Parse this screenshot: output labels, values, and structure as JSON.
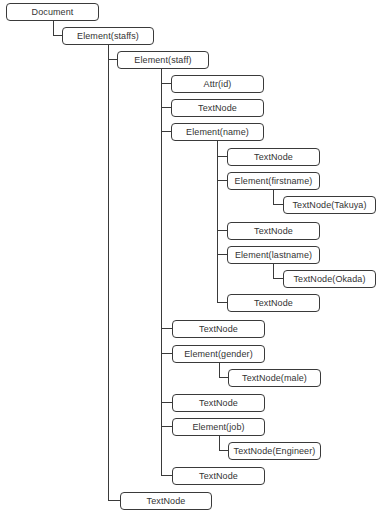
{
  "diagram": {
    "line_color": "#3a3a3a",
    "nodes": [
      {
        "label": "Document",
        "x": 6,
        "y": 3,
        "w": 93
      },
      {
        "label": "Element(staffs)",
        "x": 62,
        "y": 27,
        "w": 92
      },
      {
        "label": "Element(staff)",
        "x": 117,
        "y": 51,
        "w": 92
      },
      {
        "label": "Attr(id)",
        "x": 171,
        "y": 75,
        "w": 93
      },
      {
        "label": "TextNode",
        "x": 171,
        "y": 99,
        "w": 93
      },
      {
        "label": "Element(name)",
        "x": 171,
        "y": 123,
        "w": 93
      },
      {
        "label": "TextNode",
        "x": 227,
        "y": 148,
        "w": 93
      },
      {
        "label": "Element(firstname)",
        "x": 227,
        "y": 172,
        "w": 93
      },
      {
        "label": "TextNode(Takuya)",
        "x": 283,
        "y": 196,
        "w": 93
      },
      {
        "label": "TextNode",
        "x": 227,
        "y": 222,
        "w": 93
      },
      {
        "label": "Element(lastname)",
        "x": 227,
        "y": 246,
        "w": 93
      },
      {
        "label": "TextNode(Okada)",
        "x": 283,
        "y": 270,
        "w": 93
      },
      {
        "label": "TextNode",
        "x": 227,
        "y": 294,
        "w": 93
      },
      {
        "label": "TextNode",
        "x": 172,
        "y": 320,
        "w": 93
      },
      {
        "label": "Element(gender)",
        "x": 172,
        "y": 345,
        "w": 93
      },
      {
        "label": "TextNode(male)",
        "x": 228,
        "y": 369,
        "w": 93
      },
      {
        "label": "TextNode",
        "x": 172,
        "y": 394,
        "w": 93
      },
      {
        "label": "Element(job)",
        "x": 172,
        "y": 418,
        "w": 93
      },
      {
        "label": "TextNode(Engineer)",
        "x": 228,
        "y": 442,
        "w": 93
      },
      {
        "label": "TextNode",
        "x": 172,
        "y": 467,
        "w": 93
      },
      {
        "label": "TextNode",
        "x": 120,
        "y": 492,
        "w": 92
      }
    ]
  }
}
